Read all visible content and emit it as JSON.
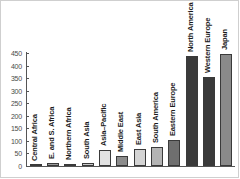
{
  "chart_data": {
    "type": "bar",
    "title": "",
    "subtitle": "",
    "xlabel": "",
    "ylabel": "",
    "ylim": [
      0,
      450
    ],
    "yticks": [
      0,
      50,
      100,
      150,
      200,
      250,
      300,
      350,
      400,
      450
    ],
    "grid": false,
    "legend": "none",
    "categories": [
      "Central Africa",
      "E. and S. Africa",
      "Northern Africa",
      "South Asia",
      "Asia–Pacific",
      "Middle East",
      "East Asia",
      "South America",
      "Eastern Europe",
      "North America",
      "Western Europe",
      "Japan"
    ],
    "values": [
      3,
      14,
      10,
      12,
      65,
      40,
      68,
      77,
      103,
      440,
      355,
      448
    ],
    "bar_colors": [
      "#9a9a9a",
      "#9a9a9a",
      "#c9c9c9",
      "#c9c9c9",
      "#e2e2e2",
      "#8c8c8c",
      "#d4d4d4",
      "#b4b4b4",
      "#6f6f6f",
      "#3a3a3a",
      "#3a3a3a",
      "#8a8a8a"
    ]
  },
  "axis": {
    "tick_labels": [
      "450",
      "400",
      "350",
      "300",
      "250",
      "200",
      "150",
      "100",
      "50",
      "0"
    ]
  }
}
